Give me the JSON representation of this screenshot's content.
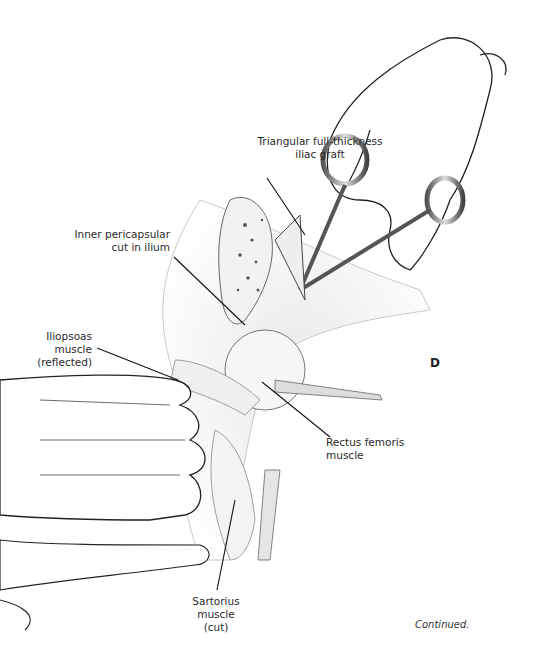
{
  "figure": {
    "panel_letter": "D",
    "continued": "Continued.",
    "labels": {
      "graft": [
        "Triangular full-thickness",
        "iliac graft"
      ],
      "inner_cut": [
        "Inner pericapsular",
        "cut in ilium"
      ],
      "iliopsoas": [
        "Iliopsoas",
        "muscle",
        "(reflected)"
      ],
      "rectus": [
        "Rectus femoris",
        "muscle"
      ],
      "sartorius": [
        "Sartorius",
        "muscle",
        "(cut)"
      ]
    }
  }
}
